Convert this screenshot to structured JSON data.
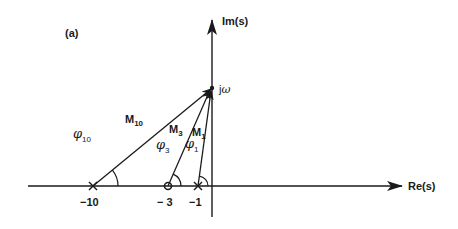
{
  "figure": {
    "panel_label": "(a)",
    "axes": {
      "imag_label": "Im(s)",
      "real_label": "Re(s)"
    },
    "test_point": {
      "label_j": "j",
      "label_omega": "ω"
    },
    "singularities": [
      {
        "type": "pole",
        "marker": "×",
        "value": -10,
        "tick_label": "−10"
      },
      {
        "type": "zero",
        "marker": "o",
        "value": -3,
        "tick_label": "− 3"
      },
      {
        "type": "pole",
        "marker": "×",
        "value": -1,
        "tick_label": "−1"
      }
    ],
    "vectors": [
      {
        "magnitude": "M",
        "magnitude_sub": "10",
        "angle": "φ",
        "angle_sub": "10"
      },
      {
        "magnitude": "M",
        "magnitude_sub": "3",
        "angle": "φ",
        "angle_sub": "3"
      },
      {
        "magnitude": "M",
        "magnitude_sub": "1",
        "angle": "φ",
        "angle_sub": "1"
      }
    ]
  },
  "colors": {
    "ink": "#1a1a1a",
    "background": "#ffffff"
  }
}
